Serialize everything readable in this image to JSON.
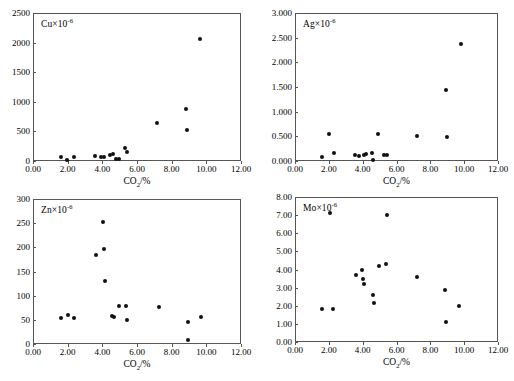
{
  "figure": {
    "panel_count": 4,
    "shared_xlabel": "CO2/%",
    "shared_xlim": [
      0,
      12
    ],
    "shared_xticks": [
      "0.00",
      "2.00",
      "4.00",
      "6.00",
      "8.00",
      "10.00",
      "12.00"
    ]
  },
  "chart_data": [
    {
      "type": "scatter",
      "title": "Cu×10⁻⁶",
      "element": "Cu",
      "xlabel": "CO2/%",
      "ylabel": "Cu×10⁻⁶",
      "xlim": [
        0,
        12
      ],
      "ylim": [
        0,
        2500
      ],
      "xticks": [
        "0.00",
        "2.00",
        "4.00",
        "6.00",
        "8.00",
        "10.00",
        "12.00"
      ],
      "yticks": [
        "0",
        "500",
        "1000",
        "1500",
        "2000",
        "2500"
      ],
      "ytick_values": [
        0,
        500,
        1000,
        1500,
        2000,
        2500
      ],
      "grid": false,
      "legend": "none",
      "points": [
        {
          "x": 1.62,
          "y": 62
        },
        {
          "x": 1.95,
          "y": 18
        },
        {
          "x": 2.35,
          "y": 72
        },
        {
          "x": 3.55,
          "y": 80
        },
        {
          "x": 3.95,
          "y": 62
        },
        {
          "x": 4.1,
          "y": 75
        },
        {
          "x": 4.45,
          "y": 95
        },
        {
          "x": 4.6,
          "y": 120
        },
        {
          "x": 4.8,
          "y": 35
        },
        {
          "x": 4.95,
          "y": 30
        },
        {
          "x": 5.3,
          "y": 215
        },
        {
          "x": 5.42,
          "y": 150
        },
        {
          "x": 7.15,
          "y": 645
        },
        {
          "x": 8.85,
          "y": 880
        },
        {
          "x": 8.88,
          "y": 520
        },
        {
          "x": 9.62,
          "y": 2060
        }
      ]
    },
    {
      "type": "scatter",
      "title": "Ag×10⁻⁶",
      "element": "Ag",
      "xlabel": "CO2/%",
      "ylabel": "Ag×10⁻⁶",
      "xlim": [
        0,
        12
      ],
      "ylim": [
        0,
        3.0
      ],
      "xticks": [
        "0.00",
        "2.00",
        "4.00",
        "6.00",
        "8.00",
        "10.00",
        "12.00"
      ],
      "yticks": [
        "0.000",
        "0.500",
        "1.000",
        "1.500",
        "2.000",
        "2.500",
        "3.000"
      ],
      "ytick_values": [
        0,
        0.5,
        1.0,
        1.5,
        2.0,
        2.5,
        3.0
      ],
      "grid": false,
      "legend": "none",
      "points": [
        {
          "x": 1.62,
          "y": 0.075
        },
        {
          "x": 2.02,
          "y": 0.545
        },
        {
          "x": 2.3,
          "y": 0.165
        },
        {
          "x": 3.55,
          "y": 0.125
        },
        {
          "x": 3.8,
          "y": 0.105
        },
        {
          "x": 4.05,
          "y": 0.125
        },
        {
          "x": 4.2,
          "y": 0.135
        },
        {
          "x": 4.55,
          "y": 0.155
        },
        {
          "x": 4.62,
          "y": 0.03
        },
        {
          "x": 4.88,
          "y": 0.545
        },
        {
          "x": 5.28,
          "y": 0.115
        },
        {
          "x": 5.45,
          "y": 0.115
        },
        {
          "x": 7.22,
          "y": 0.51
        },
        {
          "x": 8.95,
          "y": 1.435
        },
        {
          "x": 8.98,
          "y": 0.49
        },
        {
          "x": 9.82,
          "y": 2.38
        }
      ]
    },
    {
      "type": "scatter",
      "title": "Zn×10⁻⁶",
      "element": "Zn",
      "xlabel": "CO2/%",
      "ylabel": "Zn×10⁻⁶",
      "xlim": [
        0,
        12
      ],
      "ylim": [
        0,
        300
      ],
      "xticks": [
        "0.00",
        "2.00",
        "4.00",
        "6.00",
        "8.00",
        "10.00",
        "12.00"
      ],
      "yticks": [
        "0",
        "50",
        "100",
        "150",
        "200",
        "250",
        "300"
      ],
      "ytick_values": [
        0,
        50,
        100,
        150,
        200,
        250,
        300
      ],
      "grid": false,
      "legend": "none",
      "points": [
        {
          "x": 1.62,
          "y": 54
        },
        {
          "x": 2.0,
          "y": 61
        },
        {
          "x": 2.35,
          "y": 54
        },
        {
          "x": 3.62,
          "y": 185
        },
        {
          "x": 4.05,
          "y": 252
        },
        {
          "x": 4.12,
          "y": 197
        },
        {
          "x": 4.15,
          "y": 131
        },
        {
          "x": 4.58,
          "y": 57
        },
        {
          "x": 4.7,
          "y": 56
        },
        {
          "x": 4.98,
          "y": 78
        },
        {
          "x": 5.38,
          "y": 79
        },
        {
          "x": 5.42,
          "y": 50
        },
        {
          "x": 7.25,
          "y": 77
        },
        {
          "x": 8.92,
          "y": 45
        },
        {
          "x": 8.95,
          "y": 8
        },
        {
          "x": 9.72,
          "y": 56
        }
      ]
    },
    {
      "type": "scatter",
      "title": "Mo×10⁻⁶",
      "element": "Mo",
      "xlabel": "CO2/%",
      "ylabel": "Mo×10⁻⁶",
      "xlim": [
        0,
        12
      ],
      "ylim": [
        0,
        8.0
      ],
      "xticks": [
        "0.00",
        "2.00",
        "4.00",
        "6.00",
        "8.00",
        "10.00",
        "12.00"
      ],
      "yticks": [
        "0.00",
        "1.00",
        "2.00",
        "3.00",
        "4.00",
        "5.00",
        "6.00",
        "7.00",
        "8.00"
      ],
      "ytick_values": [
        0,
        1,
        2,
        3,
        4,
        5,
        6,
        7,
        8
      ],
      "grid": false,
      "legend": "none",
      "points": [
        {
          "x": 1.62,
          "y": 1.8
        },
        {
          "x": 2.05,
          "y": 7.12
        },
        {
          "x": 2.25,
          "y": 1.8
        },
        {
          "x": 3.58,
          "y": 3.68
        },
        {
          "x": 3.98,
          "y": 4.0
        },
        {
          "x": 4.02,
          "y": 3.45
        },
        {
          "x": 4.1,
          "y": 3.2
        },
        {
          "x": 4.6,
          "y": 2.6
        },
        {
          "x": 4.65,
          "y": 2.15
        },
        {
          "x": 4.95,
          "y": 4.18
        },
        {
          "x": 5.35,
          "y": 4.28
        },
        {
          "x": 5.42,
          "y": 6.98
        },
        {
          "x": 7.2,
          "y": 3.58
        },
        {
          "x": 8.88,
          "y": 2.85
        },
        {
          "x": 8.92,
          "y": 1.08
        },
        {
          "x": 9.68,
          "y": 1.98
        }
      ]
    }
  ]
}
